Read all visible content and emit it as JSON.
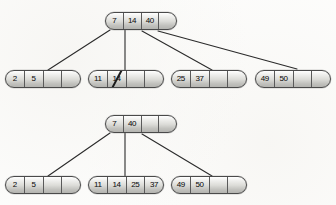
{
  "figure": {
    "kind": "b-tree-deletion-diagram",
    "colors": {
      "node_border": "#4a4a4a",
      "cell_divider": "#5a5a5a",
      "edge": "#2b2b2b",
      "text": "#1a1a1a",
      "background": "#fdfdfc",
      "strike": "#1c1c1c"
    },
    "trees": [
      {
        "name": "before-deletion",
        "root": {
          "id": "top-root",
          "cells": [
            {
              "value": "7",
              "empty": false,
              "struck": false
            },
            {
              "value": "14",
              "empty": false,
              "struck": false
            },
            {
              "value": "40",
              "empty": false,
              "struck": false
            },
            {
              "value": "",
              "empty": true,
              "struck": false
            }
          ]
        },
        "leaves": [
          {
            "id": "top-leaf-1",
            "cells": [
              {
                "value": "2",
                "empty": false,
                "struck": false
              },
              {
                "value": "5",
                "empty": false,
                "struck": false
              },
              {
                "value": "",
                "empty": true,
                "struck": false
              },
              {
                "value": "",
                "empty": true,
                "struck": false
              }
            ]
          },
          {
            "id": "top-leaf-2",
            "cells": [
              {
                "value": "11",
                "empty": false,
                "struck": false
              },
              {
                "value": "14",
                "empty": false,
                "struck": true
              },
              {
                "value": "",
                "empty": true,
                "struck": false
              },
              {
                "value": "",
                "empty": true,
                "struck": false
              }
            ]
          },
          {
            "id": "top-leaf-3",
            "cells": [
              {
                "value": "25",
                "empty": false,
                "struck": false
              },
              {
                "value": "37",
                "empty": false,
                "struck": false
              },
              {
                "value": "",
                "empty": true,
                "struck": false
              },
              {
                "value": "",
                "empty": true,
                "struck": false
              }
            ]
          },
          {
            "id": "top-leaf-4",
            "cells": [
              {
                "value": "49",
                "empty": false,
                "struck": false
              },
              {
                "value": "50",
                "empty": false,
                "struck": false
              },
              {
                "value": "",
                "empty": true,
                "struck": false
              },
              {
                "value": "",
                "empty": true,
                "struck": false
              }
            ]
          }
        ]
      },
      {
        "name": "after-deletion",
        "root": {
          "id": "bottom-root",
          "cells": [
            {
              "value": "7",
              "empty": false,
              "struck": false
            },
            {
              "value": "40",
              "empty": false,
              "struck": false
            },
            {
              "value": "",
              "empty": true,
              "struck": false
            },
            {
              "value": "",
              "empty": true,
              "struck": false
            }
          ]
        },
        "leaves": [
          {
            "id": "bottom-leaf-1",
            "cells": [
              {
                "value": "2",
                "empty": false,
                "struck": false
              },
              {
                "value": "5",
                "empty": false,
                "struck": false
              },
              {
                "value": "",
                "empty": true,
                "struck": false
              },
              {
                "value": "",
                "empty": true,
                "struck": false
              }
            ]
          },
          {
            "id": "bottom-leaf-2",
            "cells": [
              {
                "value": "11",
                "empty": false,
                "struck": false
              },
              {
                "value": "14",
                "empty": false,
                "struck": false
              },
              {
                "value": "25",
                "empty": false,
                "struck": false
              },
              {
                "value": "37",
                "empty": false,
                "struck": false
              }
            ]
          },
          {
            "id": "bottom-leaf-3",
            "cells": [
              {
                "value": "49",
                "empty": false,
                "struck": false
              },
              {
                "value": "50",
                "empty": false,
                "struck": false
              },
              {
                "value": "",
                "empty": true,
                "struck": false
              },
              {
                "value": "",
                "empty": true,
                "struck": false
              }
            ]
          }
        ]
      }
    ]
  }
}
